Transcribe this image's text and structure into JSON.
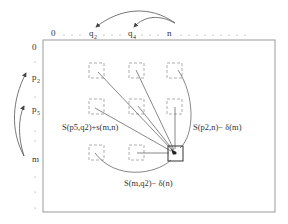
{
  "diagram": {
    "type": "dynamic-programming-grid",
    "top_axis": {
      "labels": [
        {
          "text": "0",
          "x": 54
        },
        {
          "base": "q",
          "sub": "2",
          "x": 92
        },
        {
          "base": "q",
          "sub": "4",
          "x": 130
        },
        {
          "text": "n",
          "x": 169
        }
      ],
      "dots_after_n": true
    },
    "left_axis": {
      "labels": [
        {
          "text": "0",
          "y": 50
        },
        {
          "base": "p",
          "sub": "2",
          "y": 80
        },
        {
          "base": "p",
          "sub": "5",
          "y": 112
        },
        {
          "text": "m",
          "y": 162
        }
      ]
    },
    "annotations": {
      "left_expr": "S(p5,q2)+s(m,n)",
      "right_expr": "S(p2,n)− δ(m)",
      "bottom_expr": "S(m,q2)− δ(n)"
    },
    "colors": {
      "line": "#555555",
      "dashed_box": "#9a9a9a",
      "frame": "#999999",
      "text": "#333333"
    }
  }
}
